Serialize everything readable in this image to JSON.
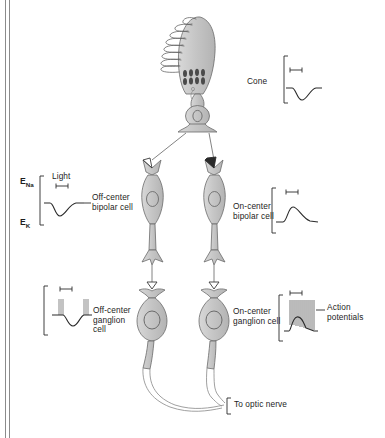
{
  "figure": {
    "border_color": "#8b8b8b",
    "cell_fill": "#c9c9c9",
    "cell_stroke": "#6b6b6b",
    "trace_color": "#2a2a2a",
    "bracket_color": "#2a2a2a"
  },
  "labels": {
    "cone": "Cone",
    "off_bipolar": "Off-center\nbipolar cell",
    "on_bipolar": "On-center\nbipolar cell",
    "off_ganglion": "Off-center\nganglion\ncell",
    "on_ganglion": "On-center\nganglion cell",
    "action_potentials": "Action\npotentials",
    "optic_nerve": "To optic nerve",
    "light": "Light",
    "e_na_symbol": "E",
    "e_na_sub": "Na",
    "e_k_symbol": "E",
    "e_k_sub": "K"
  },
  "cells": [
    {
      "name": "cone-photoreceptor",
      "type": "photoreceptor",
      "label": "Cone",
      "discs": 12,
      "mitochondria_rows": 2
    },
    {
      "name": "off-center-bipolar-cell",
      "type": "bipolar",
      "polarity": "off",
      "synapse": "open-arrowhead"
    },
    {
      "name": "on-center-bipolar-cell",
      "type": "bipolar",
      "polarity": "on",
      "synapse": "filled-arrowhead"
    },
    {
      "name": "off-center-ganglion-cell",
      "type": "ganglion",
      "polarity": "off",
      "synapse": "open-arrowhead"
    },
    {
      "name": "on-center-ganglion-cell",
      "type": "ganglion",
      "polarity": "on",
      "synapse": "open-arrowhead"
    }
  ],
  "traces": [
    {
      "name": "cone-trace",
      "cell": "Cone",
      "response": "hyperpolarizing",
      "direction": "downward",
      "spikes": false,
      "scalebar": true
    },
    {
      "name": "off-bipolar-trace",
      "cell": "Off-center bipolar cell",
      "response": "hyperpolarizing",
      "direction": "downward",
      "spikes": false,
      "scalebar": true,
      "axis_labels": [
        "E_Na",
        "E_K"
      ],
      "stimulus": "Light"
    },
    {
      "name": "on-bipolar-trace",
      "cell": "On-center bipolar cell",
      "response": "depolarizing",
      "direction": "upward",
      "spikes": false,
      "scalebar": true
    },
    {
      "name": "off-ganglion-trace",
      "cell": "Off-center ganglion cell",
      "response": "hyperpolarizing with spike bursts before and after light",
      "direction": "downward",
      "spikes": true,
      "spike_groups": 2,
      "scalebar": true
    },
    {
      "name": "on-ganglion-trace",
      "cell": "On-center ganglion cell",
      "response": "depolarizing with burst of action potentials",
      "direction": "upward",
      "spikes": true,
      "spike_count": 13,
      "scalebar": true
    }
  ]
}
